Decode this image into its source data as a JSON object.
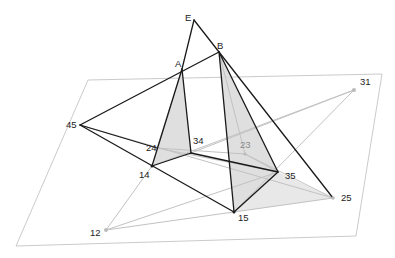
{
  "diagram": {
    "type": "3d-geometry-projection",
    "colors": {
      "background": "#ffffff",
      "plane_edge": "#b8b8b8",
      "solid_edge": "#1a1a1a",
      "projection_line": "#c4c4c4",
      "fill": "#d4d4d4",
      "label": "#222222",
      "label_hidden": "#8a8a8a"
    },
    "plane": {
      "corners": [
        [
          88,
          80
        ],
        [
          382,
          74
        ],
        [
          356,
          236
        ],
        [
          16,
          246
        ]
      ]
    },
    "points": {
      "E": {
        "label": "E",
        "x": 194,
        "y": 20
      },
      "A": {
        "label": "A",
        "x": 182,
        "y": 69
      },
      "B": {
        "label": "B",
        "x": 219,
        "y": 52
      },
      "p45": {
        "label": "45",
        "x": 80,
        "y": 125
      },
      "p24": {
        "label": "24",
        "x": 157,
        "y": 148
      },
      "p34": {
        "label": "34",
        "x": 191,
        "y": 153
      },
      "p14": {
        "label": "14",
        "x": 152,
        "y": 166
      },
      "p23": {
        "label": "23",
        "x": 245,
        "y": 154
      },
      "p35": {
        "label": "35",
        "x": 278,
        "y": 172
      },
      "p15": {
        "label": "15",
        "x": 234,
        "y": 212
      },
      "p25": {
        "label": "25",
        "x": 333,
        "y": 198
      },
      "p31": {
        "label": "31",
        "x": 354,
        "y": 90
      },
      "p12": {
        "label": "12",
        "x": 106,
        "y": 230
      }
    },
    "labels": {
      "E": "E",
      "A": "A",
      "B": "B",
      "p45": "45",
      "p24": "24",
      "p34": "34",
      "p14": "14",
      "p23": "23",
      "p35": "35",
      "p15": "15",
      "p25": "25",
      "p31": "31",
      "p12": "12"
    }
  }
}
